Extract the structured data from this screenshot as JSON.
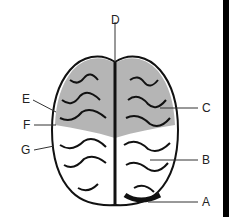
{
  "diagram": {
    "labels": [
      {
        "id": "D",
        "text": "D",
        "x": 111,
        "y": 14
      },
      {
        "id": "E",
        "text": "E",
        "x": 22,
        "y": 93
      },
      {
        "id": "F",
        "text": "F",
        "x": 23,
        "y": 119
      },
      {
        "id": "G",
        "text": "G",
        "x": 21,
        "y": 144
      },
      {
        "id": "C",
        "text": "C",
        "x": 202,
        "y": 102
      },
      {
        "id": "B",
        "text": "B",
        "x": 202,
        "y": 154
      },
      {
        "id": "A",
        "text": "A",
        "x": 202,
        "y": 196
      }
    ],
    "colors": {
      "frontal_shade": "#b5b5b5",
      "outline": "#111111",
      "white_matter": "#ffffff",
      "bar": "#000000"
    }
  }
}
